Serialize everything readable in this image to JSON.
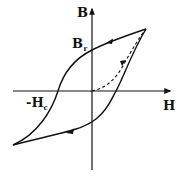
{
  "diagram": {
    "type": "magnetic hysteresis loop",
    "labels": {
      "y_axis": "B",
      "x_axis": "H",
      "remanence": "B",
      "remanence_sub": "r",
      "coercivity": "-H",
      "coercivity_sub": "c"
    },
    "colors": {
      "stroke": "#111111",
      "background": "#ffffff"
    },
    "curves": [
      {
        "name": "upper-branch",
        "direction": "right-to-left",
        "style": "solid"
      },
      {
        "name": "lower-branch",
        "direction": "left-to-right",
        "style": "solid"
      },
      {
        "name": "initial-magnetization-curve",
        "direction": "origin-to-saturation",
        "style": "dashed"
      }
    ]
  }
}
